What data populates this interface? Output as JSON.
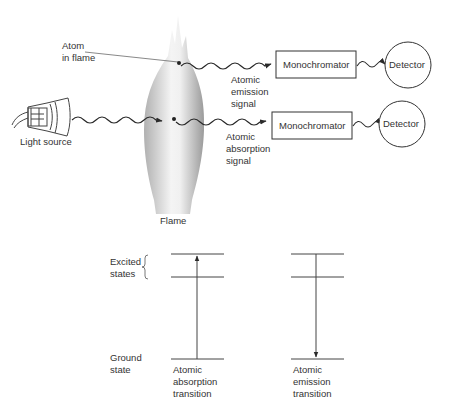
{
  "labels": {
    "atom_in_flame": "Atom\nin flame",
    "light_source": "Light source",
    "flame": "Flame",
    "emission_signal": "Atomic\nemission\nsignal",
    "absorption_signal": "Atomic\nabsorption\nsignal",
    "monochromator_top": "Monochromator",
    "monochromator_bottom": "Monochromator",
    "detector_top": "Detector",
    "detector_bottom": "Detector",
    "excited_states": "Excited\nstates",
    "ground_state": "Ground\nstate",
    "absorption_transition": "Atomic\nabsorption\ntransition",
    "emission_transition": "Atomic\nemission\ntransition"
  },
  "icons": {
    "light_source": "lamp-bulb-icon",
    "flame": "flame-icon",
    "atom": "atom-dot-icon"
  },
  "colors": {
    "line": "#2a2a2a",
    "flame_light": "#f2f2f2",
    "flame_dark": "#b8b8b8"
  }
}
